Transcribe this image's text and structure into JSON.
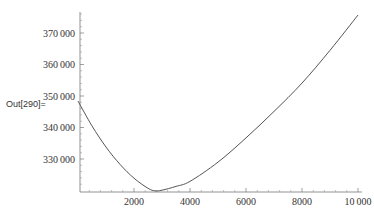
{
  "cell": {
    "output_label": "Out[290]="
  },
  "chart_data": {
    "type": "line",
    "title": "",
    "xlabel": "",
    "ylabel": "",
    "xlim": [
      0,
      10000
    ],
    "ylim": [
      320000,
      376000
    ],
    "grid": false,
    "legend": null,
    "x_ticks": [
      2000,
      4000,
      6000,
      8000,
      10000
    ],
    "x_tick_labels": [
      "2000",
      "4000",
      "6000",
      "8000",
      "10 000"
    ],
    "y_ticks": [
      330000,
      340000,
      350000,
      360000,
      370000
    ],
    "y_tick_labels": [
      "330 000",
      "340 000",
      "350 000",
      "360 000",
      "370 000"
    ],
    "series": [
      {
        "name": "f(x)",
        "color": "#555555",
        "x": [
          0,
          500,
          1000,
          1500,
          2000,
          2500,
          2750,
          3000,
          3500,
          4000,
          5000,
          6000,
          7000,
          8000,
          9000,
          10000
        ],
        "y": [
          348400,
          340500,
          333800,
          328300,
          323900,
          320700,
          319900,
          320100,
          321300,
          322900,
          329000,
          336700,
          345100,
          354100,
          364500,
          375700
        ]
      }
    ]
  }
}
